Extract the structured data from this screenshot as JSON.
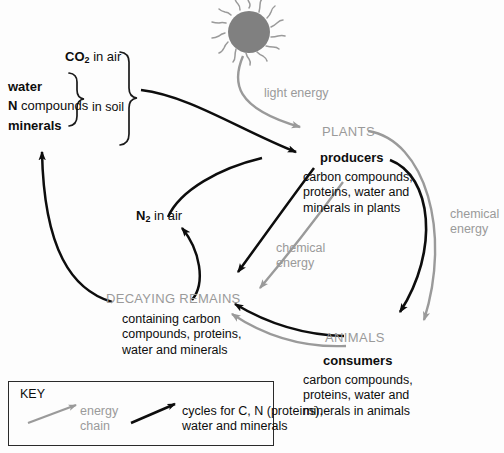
{
  "diagram": {
    "background_color": "#fdfdfd",
    "black": "#0d0d0d",
    "gray": "#9a9a9a"
  },
  "sun": {
    "name": "sun",
    "fill": "#808080",
    "rays": 16
  },
  "pools": {
    "co2": {
      "formula": "CO",
      "subscript": "2",
      "suffix": " in air"
    },
    "water": "water",
    "n_compounds_bold": "N",
    "n_compounds_rest": " compounds",
    "minerals": "minerals",
    "in_soil": "in soil",
    "n2": {
      "formula": "N",
      "subscript": "2",
      "suffix": " in air"
    }
  },
  "plants": {
    "heading": "PLANTS",
    "role": "producers",
    "body_lines": [
      "carbon compounds,",
      "proteins, water and",
      "minerals in plants"
    ]
  },
  "animals": {
    "heading": "ANIMALS",
    "role": "consumers",
    "body_lines": [
      "carbon compounds,",
      "proteins, water and",
      "minerals in animals"
    ]
  },
  "decay": {
    "heading": "DECAYING REMAINS",
    "body_lines": [
      "containing carbon",
      "compounds, proteins,",
      "water and minerals"
    ]
  },
  "energy_labels": {
    "light_energy": "light energy",
    "chemical_energy_right_line1": "chemical",
    "chemical_energy_right_line2": "energy",
    "chemical_energy_mid_line1": "chemical",
    "chemical_energy_mid_line2": "energy"
  },
  "key": {
    "title": "KEY",
    "energy_line1": "energy",
    "energy_line2": "chain",
    "cycles_line1": "cycles for C, N (proteins),",
    "cycles_line2": "water and minerals"
  }
}
